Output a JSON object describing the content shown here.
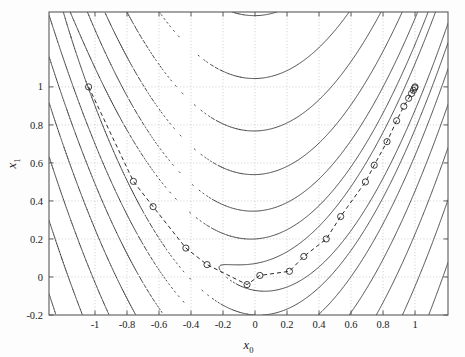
{
  "figure": {
    "type": "contour-with-path",
    "background": "#ffffff",
    "line_color": "#2b2b2b",
    "grid_color": "#b9b9b9",
    "axis_color": "#5a5a5a",
    "marker_color": "#2b2b2b"
  },
  "axes": {
    "xlabel": "x_0",
    "xlabel_base": "x",
    "xlabel_sub": "0",
    "ylabel_base": "x",
    "ylabel_sub": "1",
    "xlim": [
      -1.2875,
      1.206
    ],
    "ylim": [
      -0.2,
      1.394
    ],
    "xticks": [
      -1,
      -0.8,
      -0.6,
      -0.4,
      -0.2,
      0,
      0.2,
      0.4,
      0.6,
      0.8,
      1
    ],
    "xticklabels": [
      "-1",
      "-0.8",
      "-0.6",
      "-0.4",
      "-0.2",
      "0",
      "0.2",
      "0.4",
      "0.6",
      "0.8",
      "1"
    ],
    "yticks": [
      -0.2,
      0,
      0.2,
      0.4,
      0.6,
      0.8,
      1
    ],
    "yticklabels": [
      "-0.2",
      "0",
      "0.2",
      "0.4",
      "0.6",
      "0.8",
      "1"
    ],
    "grid": true,
    "grid_style": "dotted",
    "box": true
  },
  "chart_data": {
    "type": "line",
    "title": "",
    "xlabel": "x_0",
    "ylabel": "x_1",
    "xlim": [
      -1.2875,
      1.206
    ],
    "ylim": [
      -0.2,
      1.394
    ],
    "grid": true,
    "legend": "none",
    "surface": {
      "name": "Rosenbrock",
      "formula": "f(x0,x1) = (1 - x0)^2 + 100*(x1 - x0^2)^2",
      "a": 1,
      "b": 100
    },
    "contour_levels": [
      1.5,
      5,
      13,
      30,
      60,
      110,
      190,
      310,
      480,
      720,
      1050
    ],
    "series": [
      {
        "name": "optimization path",
        "style": "dashed-with-circle-markers",
        "x": [
          -1.04,
          -0.76,
          -0.637,
          -0.432,
          -0.3,
          -0.05,
          0.03,
          0.215,
          0.305,
          0.445,
          0.535,
          0.69,
          0.745,
          0.825,
          0.885,
          0.93,
          0.96,
          0.978,
          0.99,
          0.998,
          1.0
        ],
        "y": [
          1.0,
          0.503,
          0.37,
          0.152,
          0.065,
          -0.04,
          0.008,
          0.03,
          0.108,
          0.2,
          0.318,
          0.5,
          0.588,
          0.712,
          0.822,
          0.898,
          0.94,
          0.965,
          0.982,
          0.995,
          1.0
        ]
      }
    ],
    "start_point": [
      -1.04,
      1.0
    ],
    "end_point": [
      1.0,
      1.0
    ],
    "n_iterations": 21
  }
}
